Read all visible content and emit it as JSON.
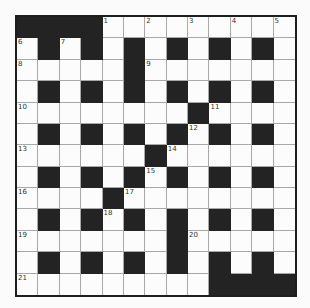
{
  "puzzle": {
    "rows": 13,
    "cols": 13,
    "colors": {
      "block": "#232323",
      "open": "#fcfcfc",
      "gridline": "#a8a8a8",
      "border": "#1e1e1e"
    },
    "grid": [
      "####.........",
      ".#.#.#.#.#.#.",
      ".....#.......",
      ".#.#.#.#.#.#.",
      "........#....",
      ".#.#.#.#.#.#.",
      "......#......",
      ".#.#.#.#.#.#.",
      "....#........",
      ".#.#.#.#.#.#.",
      ".......#.....",
      ".#.#.#.#.#.#.",
      ".........####"
    ],
    "numbers": [
      {
        "row": 0,
        "col": 4,
        "n": "1"
      },
      {
        "row": 0,
        "col": 6,
        "n": "2"
      },
      {
        "row": 0,
        "col": 8,
        "n": "3"
      },
      {
        "row": 0,
        "col": 10,
        "n": "4"
      },
      {
        "row": 0,
        "col": 12,
        "n": "5"
      },
      {
        "row": 1,
        "col": 0,
        "n": "6"
      },
      {
        "row": 1,
        "col": 2,
        "n": "7"
      },
      {
        "row": 2,
        "col": 0,
        "n": "8"
      },
      {
        "row": 2,
        "col": 6,
        "n": "9"
      },
      {
        "row": 4,
        "col": 0,
        "n": "10"
      },
      {
        "row": 4,
        "col": 9,
        "n": "11"
      },
      {
        "row": 5,
        "col": 8,
        "n": "12"
      },
      {
        "row": 6,
        "col": 0,
        "n": "13"
      },
      {
        "row": 6,
        "col": 7,
        "n": "14"
      },
      {
        "row": 7,
        "col": 6,
        "n": "15"
      },
      {
        "row": 8,
        "col": 0,
        "n": "16"
      },
      {
        "row": 8,
        "col": 5,
        "n": "17"
      },
      {
        "row": 9,
        "col": 4,
        "n": "18"
      },
      {
        "row": 10,
        "col": 0,
        "n": "19"
      },
      {
        "row": 10,
        "col": 8,
        "n": "20"
      },
      {
        "row": 12,
        "col": 0,
        "n": "21"
      }
    ]
  }
}
